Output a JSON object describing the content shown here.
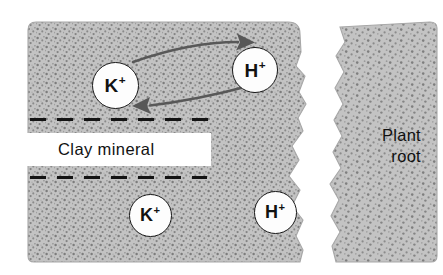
{
  "figure": {
    "background_color": "#ffffff",
    "soil_fill_color": "#c2c2c2",
    "stipple_color": "#6e6e6e",
    "outline_color": "#181818",
    "arrow_color": "#565656",
    "text_color": "#111111"
  },
  "labels": {
    "clay_mineral": "Clay mineral",
    "plant_root_line1": "Plant",
    "plant_root_line2": "root"
  },
  "ions": [
    {
      "id": "k-upper",
      "element": "K",
      "charge": "+",
      "cx": 115,
      "cy": 85,
      "r": 23.5,
      "font_size": 19
    },
    {
      "id": "h-upper",
      "element": "H",
      "charge": "+",
      "cx": 255,
      "cy": 70,
      "r": 23.0,
      "font_size": 19
    },
    {
      "id": "k-lower",
      "element": "K",
      "charge": "+",
      "cx": 150,
      "cy": 215,
      "r": 21.5,
      "font_size": 18
    },
    {
      "id": "h-lower",
      "element": "H",
      "charge": "+",
      "cx": 275,
      "cy": 212,
      "r": 21.5,
      "font_size": 18
    }
  ],
  "arrows": [
    {
      "id": "k-to-root",
      "direction": "right",
      "from": "K+ site",
      "to": "H+ ion",
      "color": "#565656"
    },
    {
      "id": "h-to-clay",
      "direction": "left",
      "from": "H+ ion",
      "to": "K+ site",
      "color": "#565656"
    }
  ],
  "clay_layers": [
    {
      "id": "upper-dashed-layer",
      "y": 119,
      "x_start": 30,
      "x_end": 211
    },
    {
      "id": "lower-dashed-layer",
      "y": 177,
      "x_start": 30,
      "x_end": 207
    }
  ],
  "regions": [
    {
      "id": "soil-mass",
      "name": "Soil / clay mineral mass",
      "description": "Stippled gray block, left portion, irregular right margin"
    },
    {
      "id": "plant-root",
      "name": "Plant root",
      "description": "Stippled gray column, right portion"
    },
    {
      "id": "root-gap",
      "name": "Gap between soil and root",
      "description": "White irregular channel"
    }
  ]
}
